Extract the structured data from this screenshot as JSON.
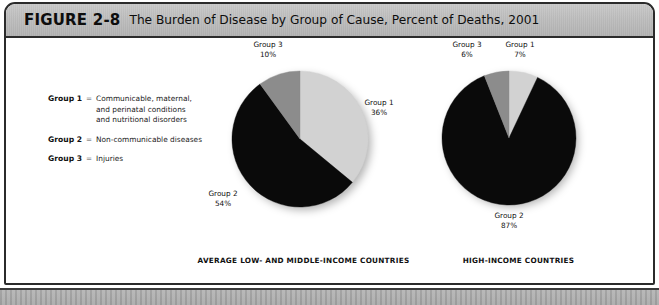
{
  "figure": {
    "number": "FIGURE 2-8",
    "title": "The Burden of Disease by Group of Cause, Percent of Deaths, 2001"
  },
  "legend": {
    "separator": "=",
    "items": [
      {
        "key": "Group 1",
        "description": "Communicable, maternal,\nand perinatal conditions\nand nutritional disorders"
      },
      {
        "key": "Group 2",
        "description": "Non-communicable diseases"
      },
      {
        "key": "Group 3",
        "description": "Injuries"
      }
    ]
  },
  "colors": {
    "group1": "#d2d2d2",
    "group2": "#0a0a0a",
    "group3": "#8c8c8c",
    "header_band": "#bdbdbd",
    "frame_border": "#2b2b2b"
  },
  "chart_data": [
    {
      "type": "pie",
      "title": "AVERAGE LOW- AND MIDDLE-INCOME COUNTRIES",
      "categories": [
        "Group 1",
        "Group 2",
        "Group 3"
      ],
      "values": [
        36,
        54,
        10
      ],
      "value_labels": [
        "36%",
        "54%",
        "10%"
      ],
      "unit": "percent of deaths",
      "colors": [
        "#d2d2d2",
        "#0a0a0a",
        "#8c8c8c"
      ],
      "start_angle_deg": 0,
      "direction": "clockwise",
      "legend": "labels on slices"
    },
    {
      "type": "pie",
      "title": "HIGH-INCOME COUNTRIES",
      "categories": [
        "Group 1",
        "Group 2",
        "Group 3"
      ],
      "values": [
        7,
        87,
        6
      ],
      "value_labels": [
        "7%",
        "87%",
        "6%"
      ],
      "unit": "percent of deaths",
      "colors": [
        "#d2d2d2",
        "#0a0a0a",
        "#8c8c8c"
      ],
      "start_angle_deg": 0,
      "direction": "clockwise",
      "legend": "labels on slices"
    }
  ],
  "charts": {
    "lmic": {
      "caption": "AVERAGE LOW- AND MIDDLE-INCOME COUNTRIES",
      "labels": {
        "group1_name": "Group 1",
        "group1_pct": "36%",
        "group2_name": "Group 2",
        "group2_pct": "54%",
        "group3_name": "Group 3",
        "group3_pct": "10%"
      }
    },
    "hic": {
      "caption": "HIGH-INCOME COUNTRIES",
      "labels": {
        "group1_name": "Group 1",
        "group1_pct": "7%",
        "group2_name": "Group 2",
        "group2_pct": "87%",
        "group3_name": "Group 3",
        "group3_pct": "6%"
      }
    }
  }
}
